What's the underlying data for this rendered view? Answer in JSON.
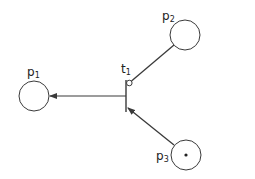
{
  "diagram": {
    "type": "petri-net",
    "colors": {
      "stroke": "#3a3a3a",
      "background": "#ffffff",
      "text": "#222222"
    },
    "places": [
      {
        "id": "p1",
        "base": "p",
        "sub": "1",
        "cx": 34,
        "cy": 96,
        "r": 15,
        "tokens": 0
      },
      {
        "id": "p2",
        "base": "p",
        "sub": "2",
        "cx": 185,
        "cy": 35,
        "r": 15,
        "tokens": 0
      },
      {
        "id": "p3",
        "base": "p",
        "sub": "3",
        "cx": 186,
        "cy": 155,
        "r": 15,
        "tokens": 1
      }
    ],
    "transitions": [
      {
        "id": "t1",
        "base": "t",
        "sub": "1",
        "x": 126,
        "y1": 80,
        "y2": 112
      }
    ],
    "arcs": [
      {
        "from": "p2",
        "to": "t1",
        "kind": "inhibitor"
      },
      {
        "from": "t1",
        "to": "p1",
        "kind": "output"
      },
      {
        "from": "p3",
        "to": "t1",
        "kind": "input"
      }
    ]
  }
}
